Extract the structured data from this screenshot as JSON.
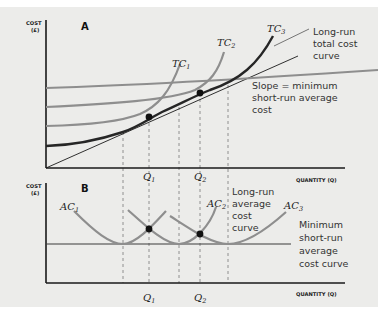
{
  "panel_a": {
    "label": "A",
    "y_axis_label_1": "COST",
    "y_axis_label_2": "(£)",
    "x_axis_label": "QUANTITY (Q)",
    "curves": [
      {
        "name": "TC",
        "sub": "1"
      },
      {
        "name": "TC",
        "sub": "2"
      },
      {
        "name": "TC",
        "sub": "3"
      }
    ],
    "annotations": {
      "long_run_total": [
        "Long-run",
        "total cost",
        "curve"
      ],
      "slope_note": [
        "Slope = minimum",
        "short-run average",
        "cost"
      ]
    },
    "q_ticks": [
      {
        "name": "Q",
        "sub": "1"
      },
      {
        "name": "Q",
        "sub": "2"
      }
    ]
  },
  "panel_b": {
    "label": "B",
    "y_axis_label_1": "COST",
    "y_axis_label_2": "(£)",
    "x_axis_label": "QUANTITY (Q)",
    "curves": [
      {
        "name": "AC",
        "sub": "1"
      },
      {
        "name": "AC",
        "sub": "2"
      },
      {
        "name": "AC",
        "sub": "3"
      }
    ],
    "annotations": {
      "long_run_average": [
        "Long-run",
        "average",
        "cost",
        "curve"
      ],
      "minimum_short_run": [
        "Minimum",
        "short-run",
        "average",
        "cost curve"
      ]
    },
    "q_ticks": [
      {
        "name": "Q",
        "sub": "1"
      },
      {
        "name": "Q",
        "sub": "2"
      }
    ]
  },
  "colors": {
    "background": "#ececea",
    "axis": "#1a1a1a",
    "short_run_curve": "#8c8c8c",
    "long_run_curve": "#2a2a2a",
    "dashed": "#777777"
  }
}
